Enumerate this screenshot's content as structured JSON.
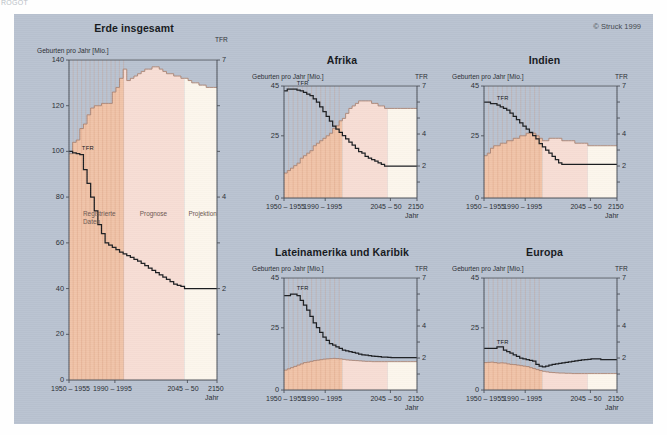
{
  "corner_text": "ROGOT",
  "copyright": "© Struck 1999",
  "labels": {
    "ylabel": "Geburten pro Jahr [Mio.]",
    "tfr_axis": "TFR",
    "tfr_line_tag": "TFR",
    "xaxis_name": "Jahr",
    "zone_registered": "Registrierte\nDaten",
    "zone_forecast": "Prognose",
    "zone_projection": "Projektion",
    "xticks": [
      "1950 – 1955",
      "1990 – 1995",
      "2045 – 50",
      "2150"
    ]
  },
  "colors": {
    "background": "#b9c2d0",
    "registered": "#f0c3a8",
    "forecast": "#f7ddd4",
    "projection": "#fcf6ec",
    "line": "#1b1d20",
    "axis": "#4a4f57"
  },
  "chart_data": [
    {
      "id": "erde",
      "type": "area",
      "title": "Erde insgesamt",
      "ylabel": "Geburten pro Jahr [Mio.]",
      "xlabel": "Jahr",
      "ylim": [
        0,
        140
      ],
      "yticks": [
        0,
        20,
        40,
        60,
        80,
        100,
        120,
        140
      ],
      "r_label": "TFR",
      "rlim": [
        0,
        7
      ],
      "rticks": [
        2,
        4,
        7
      ],
      "xticks": [
        "1950 – 1955",
        "1990 – 1995",
        "2045 – 50",
        "2150"
      ],
      "zones": {
        "registered_end_pct": 37,
        "forecast_end_pct": 78
      },
      "series": [
        {
          "name": "Geburten pro Jahr [Mio.]",
          "type": "area",
          "values": [
            99,
            104,
            105,
            110,
            112,
            116,
            119,
            120,
            120,
            121,
            121,
            121,
            126,
            128,
            132,
            136,
            131,
            132,
            133,
            134,
            135,
            136,
            136,
            137,
            137,
            136,
            135,
            134,
            134,
            133,
            133,
            132,
            132,
            131,
            130,
            130,
            129,
            129,
            128,
            128,
            128,
            128
          ]
        },
        {
          "name": "TFR",
          "type": "line",
          "values": [
            5.0,
            4.97,
            4.95,
            4.93,
            4.6,
            4.3,
            4.0,
            3.7,
            3.4,
            3.2,
            3.0,
            2.95,
            2.9,
            2.85,
            2.8,
            2.76,
            2.72,
            2.68,
            2.64,
            2.6,
            2.55,
            2.5,
            2.45,
            2.4,
            2.35,
            2.3,
            2.25,
            2.2,
            2.15,
            2.1,
            2.07,
            2.05,
            2.0,
            2.0,
            2.0,
            2.0,
            2.0,
            2.0,
            2.0,
            2.0,
            2.0,
            2.0
          ]
        }
      ]
    },
    {
      "id": "afrika",
      "type": "area",
      "title": "Afrika",
      "ylabel": "Geburten pro Jahr [Mio.]",
      "xlabel": "Jahr",
      "ylim": [
        0,
        45
      ],
      "yticks": [
        0,
        25,
        45
      ],
      "r_label": "TFR",
      "rlim": [
        0,
        7
      ],
      "rticks": [
        2,
        4,
        7
      ],
      "xticks": [
        "1950 – 1955",
        "1990 – 1995",
        "2045 – 50",
        "2150"
      ],
      "zones": {
        "registered_end_pct": 44,
        "forecast_end_pct": 78
      },
      "series": [
        {
          "name": "Geburten pro Jahr [Mio.]",
          "type": "area",
          "values": [
            10,
            11,
            12,
            13,
            14,
            16,
            17,
            18,
            19,
            21,
            22,
            23,
            24,
            25,
            26,
            28,
            29,
            31,
            32,
            34,
            36,
            37,
            38,
            39,
            39,
            39,
            39,
            38,
            38,
            37,
            37,
            36,
            36,
            36,
            36,
            36,
            36,
            36,
            36,
            36,
            36,
            36
          ]
        },
        {
          "name": "TFR",
          "type": "line",
          "values": [
            6.7,
            6.8,
            6.8,
            6.8,
            6.75,
            6.7,
            6.6,
            6.5,
            6.4,
            6.2,
            6.0,
            5.7,
            5.4,
            5.1,
            4.8,
            4.5,
            4.3,
            4.1,
            3.9,
            3.7,
            3.5,
            3.3,
            3.1,
            2.9,
            2.8,
            2.6,
            2.5,
            2.4,
            2.3,
            2.2,
            2.1,
            2.0,
            2.0,
            2.0,
            2.0,
            2.0,
            2.0,
            2.0,
            2.0,
            2.0,
            2.0,
            2.0
          ]
        }
      ]
    },
    {
      "id": "indien",
      "type": "area",
      "title": "Indien",
      "ylabel": "Geburten pro Jahr [Mio.]",
      "xlabel": "Jahr",
      "ylim": [
        0,
        45
      ],
      "yticks": [
        0,
        25,
        45
      ],
      "r_label": "TFR",
      "rlim": [
        0,
        7
      ],
      "rticks": [
        2,
        4,
        7
      ],
      "xticks": [
        "1950 – 1955",
        "1990 – 1995",
        "2045 – 50",
        "2150"
      ],
      "zones": {
        "registered_end_pct": 44,
        "forecast_end_pct": 78
      },
      "series": [
        {
          "name": "Geburten pro Jahr [Mio.]",
          "type": "area",
          "values": [
            17,
            18,
            20,
            21,
            21,
            22,
            22,
            23,
            23,
            24,
            24,
            25,
            25,
            26,
            26,
            26,
            25,
            24,
            23,
            23,
            24,
            24,
            24,
            24,
            23,
            23,
            23,
            23,
            22,
            22,
            22,
            22,
            21,
            21,
            21,
            21,
            21,
            21,
            21,
            21,
            21,
            21
          ]
        },
        {
          "name": "TFR",
          "type": "line",
          "values": [
            6.0,
            6.0,
            5.9,
            5.9,
            5.8,
            5.7,
            5.6,
            5.5,
            5.3,
            5.1,
            4.9,
            4.7,
            4.5,
            4.3,
            4.1,
            3.9,
            3.7,
            3.4,
            3.2,
            3.0,
            2.8,
            2.6,
            2.4,
            2.2,
            2.1,
            2.1,
            2.1,
            2.1,
            2.1,
            2.1,
            2.1,
            2.1,
            2.1,
            2.1,
            2.1,
            2.1,
            2.1,
            2.1,
            2.1,
            2.1,
            2.1,
            2.1
          ]
        }
      ]
    },
    {
      "id": "lateinamerika",
      "type": "area",
      "title": "Lateinamerika und Karibik",
      "ylabel": "Geburten pro Jahr [Mio.]",
      "xlabel": "Jahr",
      "ylim": [
        0,
        45
      ],
      "yticks": [
        0,
        25,
        45
      ],
      "r_label": "TFR",
      "rlim": [
        0,
        7
      ],
      "rticks": [
        2,
        4,
        7
      ],
      "xticks": [
        "1950 – 1955",
        "1990 – 1995",
        "2045 – 50",
        "2150"
      ],
      "zones": {
        "registered_end_pct": 44,
        "forecast_end_pct": 78
      },
      "series": [
        {
          "name": "Geburten pro Jahr [Mio.]",
          "type": "area",
          "values": [
            8,
            8.5,
            9,
            9.5,
            10,
            10.5,
            11,
            11.2,
            11.5,
            11.8,
            12,
            12.2,
            12.4,
            12.5,
            12.6,
            12.7,
            12.6,
            12.5,
            12.3,
            12.1,
            12,
            11.9,
            11.8,
            11.7,
            11.6,
            11.5,
            11.5,
            11.4,
            11.4,
            11.4,
            11.4,
            11.4,
            11.4,
            11.4,
            11.4,
            11.4,
            11.4,
            11.4,
            11.4,
            11.4,
            11.4,
            11.4
          ]
        },
        {
          "name": "TFR",
          "type": "line",
          "values": [
            5.9,
            5.9,
            6.0,
            6.0,
            5.9,
            5.6,
            5.3,
            5.0,
            4.6,
            4.2,
            3.9,
            3.6,
            3.3,
            3.1,
            2.9,
            2.8,
            2.7,
            2.6,
            2.5,
            2.45,
            2.4,
            2.35,
            2.3,
            2.25,
            2.2,
            2.18,
            2.15,
            2.12,
            2.1,
            2.08,
            2.06,
            2.05,
            2.04,
            2.03,
            2.02,
            2.02,
            2.02,
            2.02,
            2.02,
            2.02,
            2.02,
            2.02
          ]
        }
      ]
    },
    {
      "id": "europa",
      "type": "area",
      "title": "Europa",
      "ylabel": "Geburten pro Jahr [Mio.]",
      "xlabel": "Jahr",
      "ylim": [
        0,
        45
      ],
      "yticks": [
        0,
        25,
        45
      ],
      "r_label": "TFR",
      "rlim": [
        0,
        7
      ],
      "rticks": [
        2,
        4,
        7
      ],
      "xticks": [
        "1950 – 1955",
        "1990 – 1995",
        "2045 – 50",
        "2150"
      ],
      "zones": {
        "registered_end_pct": 44,
        "forecast_end_pct": 78
      },
      "series": [
        {
          "name": "Geburten pro Jahr [Mio.]",
          "type": "area",
          "values": [
            11,
            11.1,
            11.2,
            11,
            10.8,
            10.9,
            10.8,
            10.5,
            10.3,
            10.2,
            10,
            9.8,
            9.6,
            9.4,
            9,
            8.6,
            8.2,
            7.8,
            7.5,
            7.3,
            7.1,
            7,
            6.9,
            6.8,
            6.8,
            6.7,
            6.7,
            6.6,
            6.6,
            6.6,
            6.6,
            6.6,
            6.6,
            6.6,
            6.6,
            6.6,
            6.6,
            6.6,
            6.6,
            6.6,
            6.6,
            6.6
          ]
        },
        {
          "name": "TFR",
          "type": "line",
          "values": [
            2.6,
            2.6,
            2.6,
            2.6,
            2.7,
            2.7,
            2.5,
            2.4,
            2.3,
            2.2,
            2.1,
            2.0,
            1.95,
            1.9,
            1.85,
            1.8,
            1.6,
            1.5,
            1.45,
            1.5,
            1.55,
            1.6,
            1.63,
            1.66,
            1.7,
            1.73,
            1.76,
            1.79,
            1.82,
            1.85,
            1.88,
            1.9,
            1.92,
            1.94,
            1.95,
            1.95,
            1.9,
            1.9,
            1.9,
            1.9,
            1.9,
            1.9
          ]
        }
      ]
    }
  ]
}
